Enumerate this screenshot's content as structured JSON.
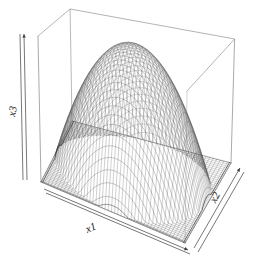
{
  "plot": {
    "type": "perspective-wireframe-3d",
    "background_color": "#ffffff",
    "line_color": "#555555",
    "box_color": "#777777",
    "width": 254,
    "height": 264
  },
  "axes": {
    "x": {
      "name": "x-axis",
      "label": "x1",
      "label_rotation_deg": -22
    },
    "y": {
      "name": "y-axis",
      "label": "x2",
      "label_rotation_deg": -62
    },
    "z": {
      "name": "z-axis",
      "label": "x3",
      "label_rotation_deg": -80
    }
  },
  "chart_data": {
    "type": "surface",
    "title": "",
    "xlabel": "x1",
    "ylabel": "x2",
    "zlabel": "x3",
    "surface_form": "dome / elliptic paraboloid, z = 1 - u^2 - v^2 style maximum at center",
    "x": [
      -1,
      -0.9,
      -0.8,
      -0.7,
      -0.6,
      -0.5,
      -0.4,
      -0.3,
      -0.2,
      -0.1,
      0,
      0.1,
      0.2,
      0.3,
      0.4,
      0.5,
      0.6,
      0.7,
      0.8,
      0.9,
      1
    ],
    "y": [
      -1,
      -0.9,
      -0.8,
      -0.7,
      -0.6,
      -0.5,
      -0.4,
      -0.3,
      -0.2,
      -0.1,
      0,
      0.1,
      0.2,
      0.3,
      0.4,
      0.5,
      0.6,
      0.7,
      0.8,
      0.9,
      1
    ],
    "zlim": [
      0,
      1
    ],
    "xlim": [
      -1,
      1
    ],
    "ylim": [
      -1,
      1
    ],
    "grid": false,
    "legend": "none",
    "mesh_lines_u": 46,
    "mesh_lines_v": 46,
    "ticks_shown": false,
    "view": {
      "theta_deg": 30,
      "phi_deg": 22,
      "perspective": true
    }
  }
}
